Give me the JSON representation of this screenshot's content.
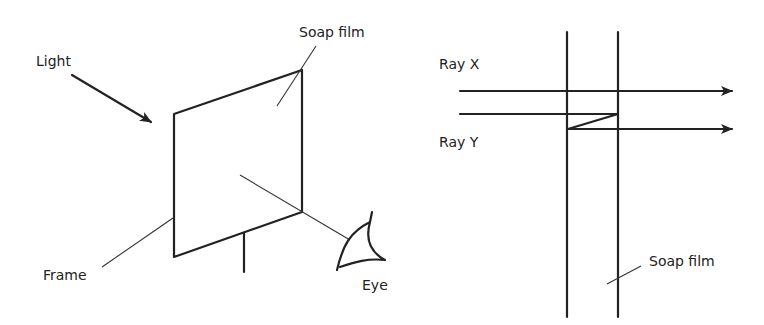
{
  "left_diagram": {
    "labels": {
      "light": "Light",
      "soap_film": "Soap film",
      "frame": "Frame",
      "eye": "Eye"
    }
  },
  "right_diagram": {
    "labels": {
      "ray_x": "Ray X",
      "ray_y": "Ray Y",
      "soap_film": "Soap film"
    }
  },
  "colors": {
    "line": "#222222",
    "background": "#ffffff"
  }
}
